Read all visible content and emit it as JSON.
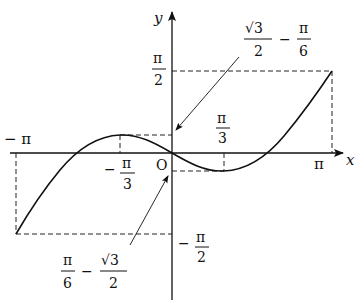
{
  "figure": {
    "function": "y = x/2 - sin x",
    "domain": "[-π, π]",
    "axes": {
      "x_label": "x",
      "y_label": "y",
      "origin_label": "O"
    },
    "x_ticks": {
      "neg_pi": "− π",
      "neg_pi_over_3_sign": "−",
      "neg_pi_over_3_num": "π",
      "neg_pi_over_3_den": "3",
      "pi_over_3_num": "π",
      "pi_over_3_den": "3",
      "pi": "π"
    },
    "y_ticks": {
      "pi_over_2_num": "π",
      "pi_over_2_den": "2",
      "neg_pi_over_2_sign": "−",
      "neg_pi_over_2_num": "π",
      "neg_pi_over_2_den": "2"
    },
    "annotations": {
      "max_value": {
        "sqrt3_num": "√3",
        "sqrt3_den": "2",
        "minus": "−",
        "pi_num": "π",
        "pi_den": "6"
      },
      "min_value": {
        "pi_num": "π",
        "pi_den": "6",
        "minus": "−",
        "sqrt3_num": "√3",
        "sqrt3_den": "2"
      }
    },
    "key_points": [
      {
        "x": "−π",
        "y": "−π/2"
      },
      {
        "x": "−π/3",
        "y": "√3/2 − π/6",
        "type": "local max"
      },
      {
        "x": "0",
        "y": "0"
      },
      {
        "x": "π/3",
        "y": "π/6 − √3/2",
        "type": "local min"
      },
      {
        "x": "π",
        "y": "π/2"
      }
    ]
  }
}
